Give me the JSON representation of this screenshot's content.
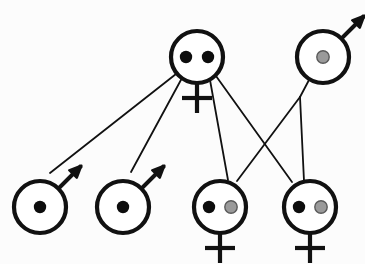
{
  "diagram": {
    "canvas": {
      "width": 365,
      "height": 264
    },
    "background_color": "#fcfcfc",
    "stroke_color": "#111111",
    "allele_colors": {
      "black": "#0d0d0d",
      "gray": "#9a9a9a",
      "gray_outline": "#5a5a5a"
    },
    "symbol_style": {
      "circle_radius": 26,
      "circle_stroke_width": 4.2,
      "link_stroke_width": 1.8,
      "allele_radius": 6.2
    },
    "individuals": [
      {
        "id": "mother-top-center",
        "label": "top-center female",
        "sex": "female",
        "sex_symbol": "venus",
        "cx": 197,
        "cy": 57,
        "alleles": [
          "black",
          "black"
        ],
        "allele_count": 2
      },
      {
        "id": "father-top-right",
        "label": "top-right male",
        "sex": "male",
        "sex_symbol": "mars",
        "cx": 323,
        "cy": 57,
        "alleles": [
          "gray"
        ],
        "allele_count": 1
      },
      {
        "id": "son-bottom-1",
        "label": "bottom male 1",
        "sex": "male",
        "sex_symbol": "mars",
        "cx": 40,
        "cy": 207,
        "alleles": [
          "black"
        ],
        "allele_count": 1
      },
      {
        "id": "son-bottom-2",
        "label": "bottom male 2",
        "sex": "male",
        "sex_symbol": "mars",
        "cx": 123,
        "cy": 207,
        "alleles": [
          "black"
        ],
        "allele_count": 1
      },
      {
        "id": "daughter-bottom-3",
        "label": "bottom female 1",
        "sex": "female",
        "sex_symbol": "venus",
        "cx": 220,
        "cy": 207,
        "alleles": [
          "black",
          "gray"
        ],
        "allele_count": 2
      },
      {
        "id": "daughter-bottom-4",
        "label": "bottom female 2",
        "sex": "female",
        "sex_symbol": "venus",
        "cx": 310,
        "cy": 207,
        "alleles": [
          "black",
          "gray"
        ],
        "allele_count": 2
      }
    ],
    "links": [
      {
        "id": "link-mother-to-son1",
        "from": "mother-top-center",
        "to": "son-bottom-1",
        "x1": 176,
        "y1": 74,
        "x2": 50,
        "y2": 173
      },
      {
        "id": "link-mother-to-son2",
        "from": "mother-top-center",
        "to": "son-bottom-2",
        "x1": 182,
        "y1": 78,
        "x2": 131,
        "y2": 172
      },
      {
        "id": "link-mother-to-daughter3",
        "from": "mother-top-center",
        "to": "daughter-bottom-3",
        "x1": 210,
        "y1": 80,
        "x2": 228,
        "y2": 180
      },
      {
        "id": "link-mother-to-daughter4",
        "from": "mother-top-center",
        "to": "daughter-bottom-4",
        "x1": 216,
        "y1": 76,
        "x2": 292,
        "y2": 182
      },
      {
        "id": "link-father-branch-stem",
        "from": "father-top-right",
        "to": "branch-point",
        "x1": 309,
        "y1": 80,
        "x2": 300,
        "y2": 97
      },
      {
        "id": "link-father-to-daughter3",
        "from": "branch-point",
        "to": "daughter-bottom-3",
        "x1": 300,
        "y1": 97,
        "x2": 237,
        "y2": 181
      },
      {
        "id": "link-father-to-daughter4",
        "from": "branch-point",
        "to": "daughter-bottom-4",
        "x1": 300,
        "y1": 97,
        "x2": 304,
        "y2": 181
      }
    ]
  }
}
